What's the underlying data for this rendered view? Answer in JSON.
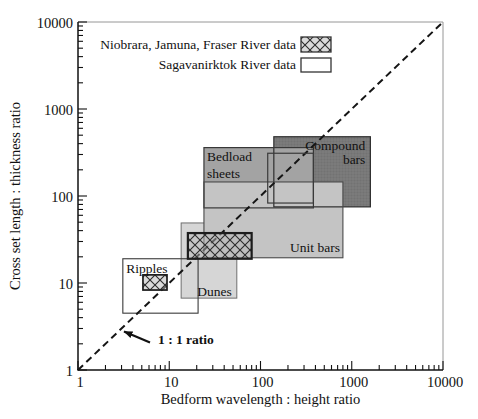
{
  "figure": {
    "width": 478,
    "height": 419,
    "background": "#ffffff",
    "plot_area_px": {
      "left": 78,
      "right": 443,
      "top": 22,
      "bottom": 370
    },
    "styles": {
      "axis_color": "#111111",
      "axis_width": 1.5,
      "frame_color": "#8a8a8a",
      "frame_width": 0.9,
      "tick_major_len": 9,
      "tick_minor_len": 5,
      "tick_width": 1.1,
      "tick_font_px": 14.5,
      "label_font_px": 13.5,
      "dash_color": "#151515",
      "dash_width": 2,
      "dash_array": "7 4.5",
      "hatch_line_color": "#2b2b2b",
      "hatch_bg": "rgba(182,182,182,0.5)",
      "texture_line": "rgba(0,0,0,0.10)"
    },
    "legend_px": {
      "text_right": 296,
      "rows": [
        {
          "baseline": 49,
          "swatch": [
            301,
            37,
            30,
            15
          ]
        },
        {
          "baseline": 69,
          "swatch": [
            301,
            58,
            30,
            14
          ]
        }
      ]
    },
    "annotation_px": {
      "text_x": 158,
      "text_y": 344,
      "arrow_from": [
        150,
        342.5
      ],
      "arrow_to": [
        124,
        331.5
      ]
    }
  },
  "chart_data": {
    "type": "box-ranges-log-log",
    "title": "",
    "xlabel": "Bedform wavelength : height ratio",
    "ylabel": "Cross set length : thickness ratio",
    "xlim": [
      1,
      10000
    ],
    "ylim": [
      1,
      10000
    ],
    "x_ticks": [
      {
        "v": 1,
        "label": "1"
      },
      {
        "v": 10,
        "label": "10"
      },
      {
        "v": 100,
        "label": "100"
      },
      {
        "v": 1000,
        "label": "1000"
      },
      {
        "v": 10000,
        "label": "10000"
      }
    ],
    "y_ticks": [
      {
        "v": 1,
        "label": "1"
      },
      {
        "v": 10,
        "label": "10"
      },
      {
        "v": 100,
        "label": "100"
      },
      {
        "v": 1000,
        "label": "1000"
      },
      {
        "v": 10000,
        "label": "10000"
      }
    ],
    "minor_ticks_per_decade": [
      2,
      3,
      4,
      5,
      6,
      7,
      8,
      9
    ],
    "reference_line": {
      "label": "1 : 1 ratio",
      "from_xy": [
        1,
        1
      ],
      "to_xy": [
        10000,
        10000
      ],
      "style": "dashed"
    },
    "legend": [
      {
        "label": "Niobrara, Jamuna, Fraser River data",
        "swatch": "crosshatch"
      },
      {
        "label": "Sagavanirktok River data",
        "swatch": "open"
      }
    ],
    "bedform_boxes": [
      {
        "id": "dunes",
        "label_lines": [
          "Dunes"
        ],
        "x_range": [
          13.5,
          55
        ],
        "y_range": [
          6.7,
          49
        ],
        "fill": "#d6d6d6",
        "stroke": "#6f6f6f",
        "stroke_width": 1,
        "texture": false,
        "outline_on_top": false,
        "label_anchor": "bl",
        "label_dx": 16,
        "label_dy": -2.5,
        "label_line_h": 15,
        "label_align": "start"
      },
      {
        "id": "compound-bars",
        "label_lines": [
          "Compound",
          "bars"
        ],
        "x_range": [
          140,
          1600
        ],
        "y_range": [
          75,
          480
        ],
        "fill": "#7b7b7b",
        "stroke": "#2e2e2e",
        "stroke_width": 1.2,
        "texture": true,
        "outline_on_top": true,
        "label_anchor": "tr",
        "label_dx": -5,
        "label_dy": 13,
        "label_line_h": 14.5,
        "label_align": "end"
      },
      {
        "id": "bedload-sheets",
        "label_lines": [
          "Bedload",
          "sheets"
        ],
        "x_range": [
          24,
          380
        ],
        "y_range": [
          73,
          360
        ],
        "fill": "#a3a3a3",
        "stroke": "#383838",
        "stroke_width": 1.2,
        "texture": false,
        "outline_on_top": true,
        "label_anchor": "tl",
        "label_dx": 3,
        "label_dy": 13,
        "label_line_h": 17.5,
        "label_align": "start"
      },
      {
        "id": "unit-bars",
        "label_lines": [
          "Unit bars"
        ],
        "x_range": [
          24,
          800
        ],
        "y_range": [
          19.5,
          145
        ],
        "fill": "#c4c4c4",
        "stroke": "#4a4a4a",
        "stroke_width": 1.1,
        "texture": false,
        "outline_on_top": true,
        "label_anchor": "br",
        "label_dx": -3,
        "label_dy": -6,
        "label_line_h": 15,
        "label_align": "end"
      },
      {
        "id": "ripples",
        "label_lines": [
          "Ripples"
        ],
        "x_range": [
          3.1,
          20.7
        ],
        "y_range": [
          4.5,
          19
        ],
        "fill": "none",
        "stroke": "#3a3a3a",
        "stroke_width": 1.1,
        "texture": false,
        "outline_on_top": true,
        "label_anchor": "tl",
        "label_dx": 3.5,
        "label_dy": 14,
        "label_line_h": 15,
        "label_align": "start"
      }
    ],
    "data_boxes": [
      {
        "id": "unit-bars-data-crosshatch",
        "style": "crosshatch",
        "x_range": [
          16,
          80
        ],
        "y_range": [
          19,
          37.5
        ],
        "stroke_width": 2.2
      },
      {
        "id": "bedload-compound-data-open",
        "style": "open",
        "x_range": [
          120,
          380
        ],
        "y_range": [
          83,
          310
        ],
        "stroke_width": 1.2
      },
      {
        "id": "ripples-data-crosshatch",
        "style": "crosshatch",
        "x_range": [
          5.15,
          9.45
        ],
        "y_range": [
          8.3,
          12.4
        ],
        "stroke_width": 1.7
      }
    ]
  }
}
